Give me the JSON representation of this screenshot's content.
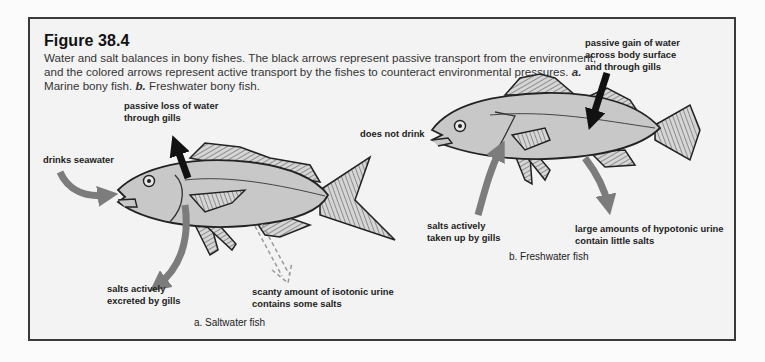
{
  "figure": {
    "title": "Figure 38.4",
    "caption_parts": {
      "text1": "Water and salt balances in bony fishes. The black arrows represent passive transport from the environment, and the colored arrows represent active transport by the fishes to counteract environmental pressures. ",
      "a_marker": "a.",
      "a_text": " Marine bony fish. ",
      "b_marker": "b.",
      "b_text": " Freshwater bony fish."
    }
  },
  "panel_a": {
    "subtitle": "a. Saltwater fish",
    "labels": {
      "passive_loss": "passive loss of water\nthrough gills",
      "drinks": "drinks seawater",
      "salts_excreted": "salts actively\nexcreted by gills",
      "urine": "scanty amount of isotonic urine\ncontains some salts"
    }
  },
  "panel_b": {
    "subtitle": "b. Freshwater fish",
    "labels": {
      "passive_gain": "passive gain of water\nacross body surface\nand through gills",
      "no_drink": "does not drink",
      "salts_taken": "salts actively\ntaken up by gills",
      "urine": "large amounts of hypotonic urine\ncontain little salts"
    }
  },
  "colors": {
    "frame_border": "#3a3a3a",
    "frame_bg": "#f3f3f3",
    "fish_body": "#c8c8c8",
    "active_arrow": "#7c7c7c",
    "passive_arrow": "#111111"
  }
}
